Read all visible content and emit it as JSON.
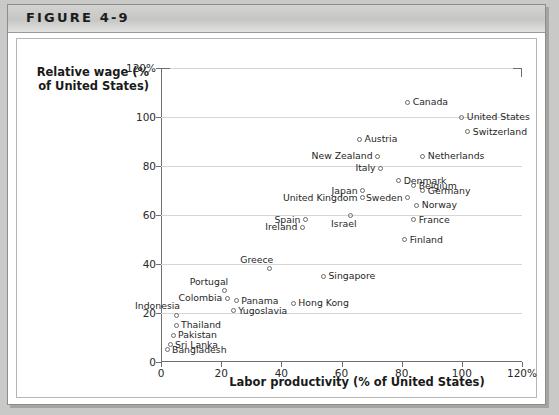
{
  "figure": {
    "number_label": "FIGURE 4-9"
  },
  "chart_data": {
    "type": "scatter",
    "title": "FIGURE 4-9",
    "xlabel": "Labor productivity (% of United States)",
    "ylabel": "Relative wage (% of United States)",
    "xlim": [
      0,
      120
    ],
    "ylim": [
      0,
      120
    ],
    "xticks": [
      "0",
      "20",
      "40",
      "60",
      "80",
      "100",
      "120%"
    ],
    "xtick_values": [
      0,
      20,
      40,
      60,
      80,
      100,
      120
    ],
    "yticks": [
      "0",
      "20",
      "40",
      "60",
      "80",
      "100",
      "120%"
    ],
    "ytick_values": [
      0,
      20,
      40,
      60,
      80,
      100,
      120
    ],
    "grid": "horizontal",
    "legend": "none",
    "annotations": [
      {
        "name": "45-degree-line",
        "from": [
          0,
          0
        ],
        "to": [
          118,
          118
        ]
      }
    ],
    "points": [
      {
        "label": "Canada",
        "x": 82,
        "y": 106,
        "label_side": "right"
      },
      {
        "label": "United States",
        "x": 100,
        "y": 100,
        "label_side": "right"
      },
      {
        "label": "Switzerland",
        "x": 102,
        "y": 94,
        "label_side": "right"
      },
      {
        "label": "Austria",
        "x": 66,
        "y": 91,
        "label_side": "right"
      },
      {
        "label": "New Zealand",
        "x": 72,
        "y": 84,
        "label_side": "left"
      },
      {
        "label": "Netherlands",
        "x": 87,
        "y": 84,
        "label_side": "right"
      },
      {
        "label": "Italy",
        "x": 73,
        "y": 79,
        "label_side": "left"
      },
      {
        "label": "Denmark",
        "x": 79,
        "y": 74,
        "label_side": "right"
      },
      {
        "label": "Belgium",
        "x": 84,
        "y": 72,
        "label_side": "right"
      },
      {
        "label": "Germany",
        "x": 87,
        "y": 70,
        "label_side": "right"
      },
      {
        "label": "Japan",
        "x": 67,
        "y": 70,
        "label_side": "left"
      },
      {
        "label": "United Kingdom",
        "x": 67,
        "y": 67,
        "label_side": "left"
      },
      {
        "label": "Sweden",
        "x": 82,
        "y": 67,
        "label_side": "left"
      },
      {
        "label": "Norway",
        "x": 85,
        "y": 64,
        "label_side": "right"
      },
      {
        "label": "Israel",
        "x": 63,
        "y": 60,
        "label_side": "below"
      },
      {
        "label": "Spain",
        "x": 48,
        "y": 58,
        "label_side": "left"
      },
      {
        "label": "Ireland",
        "x": 47,
        "y": 55,
        "label_side": "left"
      },
      {
        "label": "France",
        "x": 84,
        "y": 58,
        "label_side": "right"
      },
      {
        "label": "Finland",
        "x": 81,
        "y": 50,
        "label_side": "right"
      },
      {
        "label": "Greece",
        "x": 36,
        "y": 38,
        "label_side": "above"
      },
      {
        "label": "Singapore",
        "x": 54,
        "y": 35,
        "label_side": "right"
      },
      {
        "label": "Portugal",
        "x": 21,
        "y": 29,
        "label_side": "above"
      },
      {
        "label": "Colombia",
        "x": 22,
        "y": 26,
        "label_side": "left"
      },
      {
        "label": "Panama",
        "x": 25,
        "y": 25,
        "label_side": "right"
      },
      {
        "label": "Hong Kong",
        "x": 44,
        "y": 24,
        "label_side": "right"
      },
      {
        "label": "Indonesia",
        "x": 5,
        "y": 19,
        "label_side": "above"
      },
      {
        "label": "Yugoslavia",
        "x": 24,
        "y": 21,
        "label_side": "right"
      },
      {
        "label": "Thailand",
        "x": 5,
        "y": 15,
        "label_side": "right"
      },
      {
        "label": "Pakistan",
        "x": 4,
        "y": 11,
        "label_side": "right"
      },
      {
        "label": "Sri Lanka",
        "x": 3,
        "y": 7,
        "label_side": "right"
      },
      {
        "label": "Bangladesh",
        "x": 2,
        "y": 5,
        "label_side": "right"
      }
    ]
  }
}
